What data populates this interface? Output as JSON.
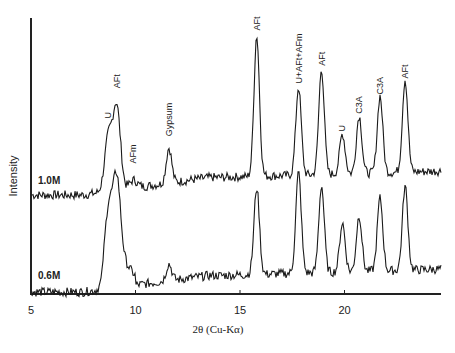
{
  "chart_data": {
    "type": "line",
    "title": "",
    "xlabel": "2θ (Cu-Kα)",
    "ylabel": "Intensity",
    "xlim": [
      5,
      24.6
    ],
    "x_ticks": [
      "5",
      "10",
      "15",
      "20"
    ],
    "grid": false,
    "legend": "inline labels on left",
    "series": [
      {
        "name": "1.0M",
        "baseline_offset": 1,
        "peaks": [
          {
            "x": 8.7,
            "height": 0.33,
            "label": "U"
          },
          {
            "x": 9.1,
            "height": 0.52,
            "label": "AFt"
          },
          {
            "x": 9.9,
            "height": 0.05,
            "label": "AFm"
          },
          {
            "x": 11.6,
            "height": 0.22,
            "label": "Gypsum"
          },
          {
            "x": 15.8,
            "height": 0.88,
            "label": "AFt"
          },
          {
            "x": 17.8,
            "height": 0.55,
            "label": "U+AFt+AFm"
          },
          {
            "x": 18.9,
            "height": 0.66,
            "label": "AFt"
          },
          {
            "x": 19.9,
            "height": 0.25,
            "label": "U"
          },
          {
            "x": 20.7,
            "height": 0.36,
            "label": "C3A"
          },
          {
            "x": 21.7,
            "height": 0.48,
            "label": "C3A"
          },
          {
            "x": 22.9,
            "height": 0.58,
            "label": "AFt"
          }
        ]
      },
      {
        "name": "0.6M",
        "baseline_offset": 0,
        "peaks": [
          {
            "x": 8.7,
            "height": 0.48
          },
          {
            "x": 9.1,
            "height": 0.62
          },
          {
            "x": 11.6,
            "height": 0.12
          },
          {
            "x": 15.8,
            "height": 0.62
          },
          {
            "x": 17.8,
            "height": 0.72
          },
          {
            "x": 18.9,
            "height": 0.62
          },
          {
            "x": 19.9,
            "height": 0.35
          },
          {
            "x": 20.7,
            "height": 0.4
          },
          {
            "x": 21.7,
            "height": 0.52
          },
          {
            "x": 22.9,
            "height": 0.6
          }
        ]
      }
    ]
  }
}
